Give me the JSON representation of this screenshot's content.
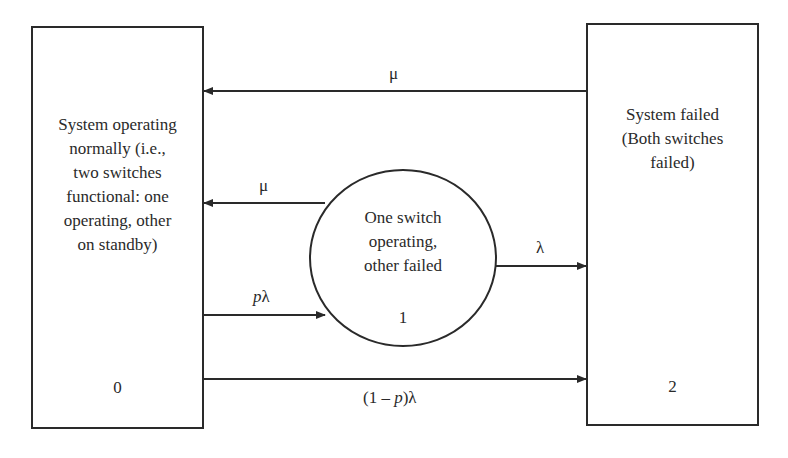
{
  "states": [
    {
      "id": 0,
      "shape": "rectangle",
      "description_lines": [
        "System operating",
        "normally (i.e.,",
        "two switches",
        "functional: one",
        "operating, other",
        "on standby)"
      ],
      "label": "0"
    },
    {
      "id": 1,
      "shape": "circle",
      "description_lines": [
        "One switch",
        "operating,",
        "other failed"
      ],
      "label": "1"
    },
    {
      "id": 2,
      "shape": "rectangle",
      "description_lines": [
        "System failed",
        "(Both switches",
        "failed)"
      ],
      "label": "2"
    }
  ],
  "transitions": [
    {
      "from": "2",
      "to": "0",
      "rate": "μ"
    },
    {
      "from": "1",
      "to": "0",
      "rate": "μ"
    },
    {
      "from": "1",
      "to": "2",
      "rate": "λ"
    },
    {
      "from": "0",
      "to": "1",
      "rate_var": "p",
      "rate_sym": "λ"
    },
    {
      "from": "0",
      "to": "2",
      "rate_pre": "(1 – ",
      "rate_var": "p",
      "rate_post": ")λ"
    }
  ],
  "colors": {
    "line": "#2a2a2a",
    "background": "#ffffff"
  }
}
